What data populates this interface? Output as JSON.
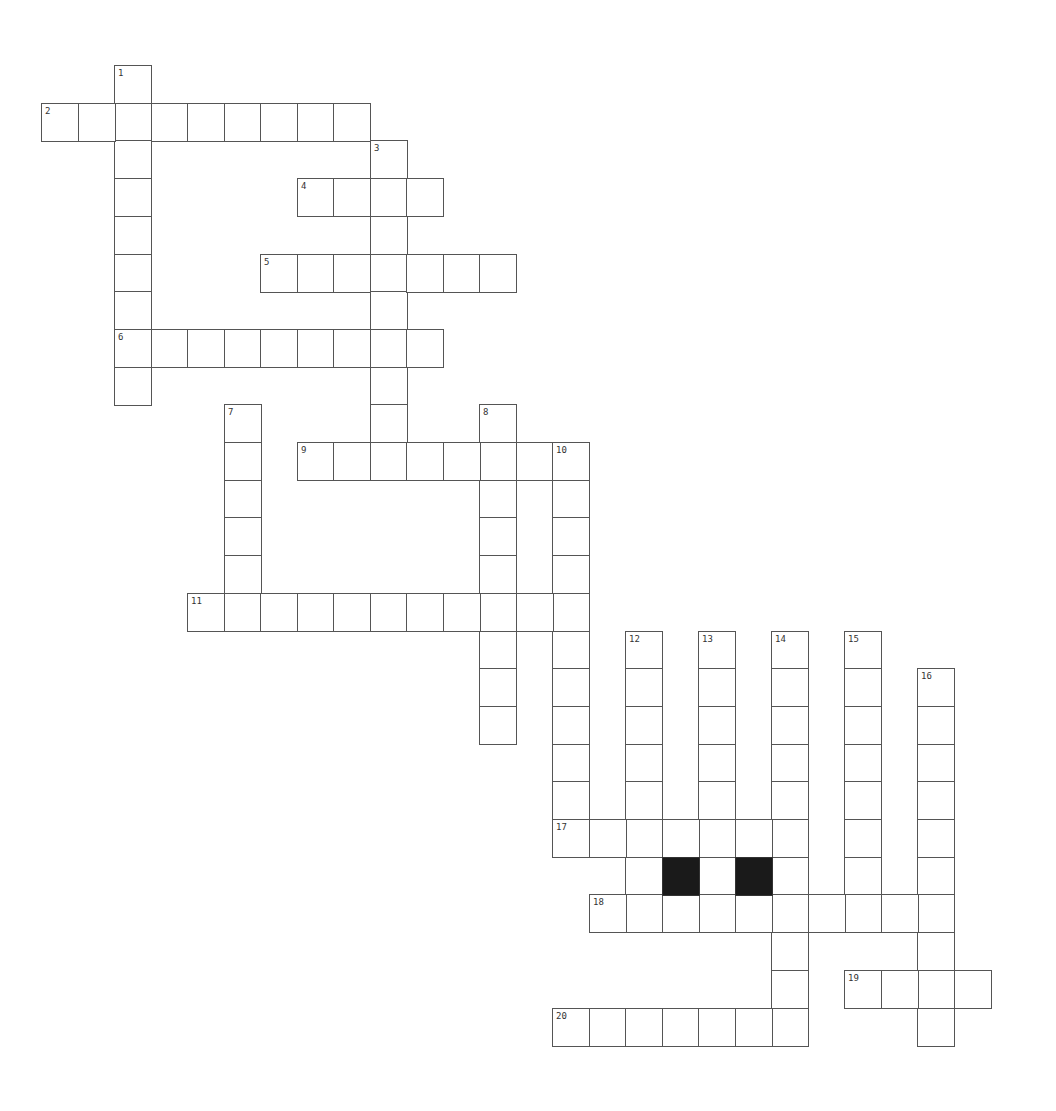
{
  "puzzle": {
    "type": "crossword",
    "grid": {
      "origin_x": 41,
      "origin_y": 65,
      "cell_w": 36.5,
      "cell_h": 37.7
    },
    "colors": {
      "cell_border": "#555555",
      "cell_fill": "#ffffff",
      "block_fill": "#1a1a1a"
    },
    "words": [
      {
        "number": "1",
        "dir": "down",
        "row": 0,
        "col": 2,
        "length": 9
      },
      {
        "number": "2",
        "dir": "across",
        "row": 1,
        "col": 0,
        "length": 9
      },
      {
        "number": "3",
        "dir": "down",
        "row": 2,
        "col": 9,
        "length": 9
      },
      {
        "number": "4",
        "dir": "across",
        "row": 3,
        "col": 7,
        "length": 4
      },
      {
        "number": "5",
        "dir": "across",
        "row": 5,
        "col": 6,
        "length": 7
      },
      {
        "number": "6",
        "dir": "across",
        "row": 7,
        "col": 2,
        "length": 9
      },
      {
        "number": "7",
        "dir": "down",
        "row": 9,
        "col": 5,
        "length": 6
      },
      {
        "number": "8",
        "dir": "down",
        "row": 9,
        "col": 12,
        "length": 9
      },
      {
        "number": "9",
        "dir": "across",
        "row": 10,
        "col": 7,
        "length": 8
      },
      {
        "number": "10",
        "dir": "down",
        "row": 10,
        "col": 14,
        "length": 11
      },
      {
        "number": "11",
        "dir": "across",
        "row": 14,
        "col": 4,
        "length": 11
      },
      {
        "number": "12",
        "dir": "down",
        "row": 15,
        "col": 16,
        "length": 8
      },
      {
        "number": "13",
        "dir": "down",
        "row": 15,
        "col": 18,
        "length": 8
      },
      {
        "number": "14",
        "dir": "down",
        "row": 15,
        "col": 20,
        "length": 11
      },
      {
        "number": "15",
        "dir": "down",
        "row": 15,
        "col": 22,
        "length": 8
      },
      {
        "number": "16",
        "dir": "down",
        "row": 16,
        "col": 24,
        "length": 10
      },
      {
        "number": "17",
        "dir": "across",
        "row": 20,
        "col": 14,
        "length": 7
      },
      {
        "number": "18",
        "dir": "across",
        "row": 22,
        "col": 15,
        "length": 10
      },
      {
        "number": "19",
        "dir": "across",
        "row": 24,
        "col": 22,
        "length": 4
      },
      {
        "number": "20",
        "dir": "across",
        "row": 25,
        "col": 14,
        "length": 7
      }
    ],
    "black_cells": [
      {
        "row": 21,
        "col": 17
      },
      {
        "row": 21,
        "col": 19
      }
    ]
  }
}
